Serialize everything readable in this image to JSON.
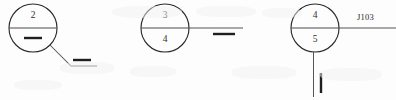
{
  "diagram": {
    "type": "welding-symbol-callouts",
    "background_color": "#fdfdfd",
    "line_color": "#2b2b2b",
    "groups": [
      {
        "id": "group-1",
        "balloon": {
          "top_number": "2",
          "bottom_number": "",
          "center_x": 33,
          "center_y": 28,
          "radius": 24
        },
        "inner_weld_mark": "square-groove-dash",
        "leader": "diagonal-down-right",
        "leader_weld_mark": "double-bar",
        "joint_label": ""
      },
      {
        "id": "group-2",
        "balloon": {
          "top_number": "3",
          "bottom_number": "4",
          "center_x": 165,
          "center_y": 28,
          "radius": 24
        },
        "inner_weld_mark": "",
        "leader": "horizontal-right",
        "leader_weld_mark": "double-bar",
        "joint_label": ""
      },
      {
        "id": "group-3",
        "balloon": {
          "top_number": "4",
          "bottom_number": "5",
          "center_x": 315,
          "center_y": 28,
          "radius": 24
        },
        "inner_weld_mark": "",
        "leader": "horizontal-right-and-vertical-down",
        "leader_weld_mark": "vertical-bar",
        "joint_label": "J103"
      }
    ]
  }
}
